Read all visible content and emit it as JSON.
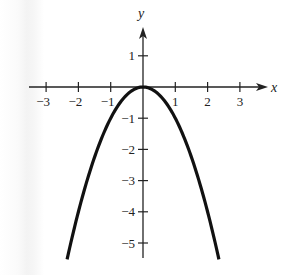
{
  "chart_data": {
    "type": "line",
    "title": "",
    "function": "y = -x^2",
    "xlabel": "x",
    "ylabel": "y",
    "xlim": [
      -3.5,
      3.7
    ],
    "ylim": [
      -5.5,
      1.8
    ],
    "x_ticks": [
      -3,
      -2,
      -1,
      1,
      2,
      3
    ],
    "x_tick_labels": [
      "−3",
      "−2",
      "−1",
      "1",
      "2",
      "3"
    ],
    "y_ticks": [
      1,
      -1,
      -2,
      -3,
      -4,
      -5
    ],
    "y_tick_labels": [
      "1",
      "−1",
      "−2",
      "−3",
      "−4",
      "−5"
    ],
    "grid": false,
    "legend": null,
    "series": [
      {
        "name": "y = -x^2",
        "x": [
          -2.35,
          -2,
          -1.5,
          -1,
          -0.5,
          0,
          0.5,
          1,
          1.5,
          2,
          2.35
        ],
        "y": [
          -5.52,
          -4,
          -2.25,
          -1,
          -0.25,
          0,
          -0.25,
          -1,
          -2.25,
          -4,
          -5.52
        ]
      }
    ],
    "vertex": [
      0,
      0
    ]
  },
  "axis_labels": {
    "x": "x",
    "y": "y"
  },
  "colors": {
    "curve": "#111111",
    "axis": "#222222",
    "background": "#ffffff"
  }
}
